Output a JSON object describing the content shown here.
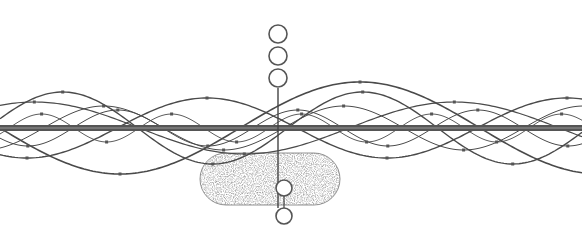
{
  "diagram": {
    "colors": {
      "background": "#ffffff",
      "line": "#4a4a4a",
      "bar": "#555555",
      "stipple": "#6e6e6e",
      "dot": "#555555"
    },
    "bar": {
      "y": 128,
      "x1": 0,
      "x2": 582,
      "thickness": 6
    },
    "axis": {
      "x": 278,
      "y1": 88,
      "y2": 208
    },
    "circles": [
      {
        "cx": 278,
        "cy": 34,
        "r": 9
      },
      {
        "cx": 278,
        "cy": 56,
        "r": 9
      },
      {
        "cx": 278,
        "cy": 78,
        "r": 9
      },
      {
        "cx": 284,
        "cy": 188,
        "r": 8,
        "filled_white": true
      },
      {
        "cx": 284,
        "cy": 216,
        "r": 8
      }
    ],
    "cell": {
      "x": 200,
      "y": 153,
      "width": 140,
      "height": 52,
      "rx": 26
    },
    "waves": [
      {
        "amp": 46,
        "period": 480,
        "phase": 0.0,
        "width": 1.6
      },
      {
        "amp": 30,
        "period": 360,
        "phase": 1.1,
        "width": 1.4
      },
      {
        "amp": 22,
        "period": 240,
        "phase": 2.0,
        "width": 1.0
      },
      {
        "amp": 18,
        "period": 180,
        "phase": 0.6,
        "width": 1.0
      },
      {
        "amp": 14,
        "period": 130,
        "phase": 2.7,
        "width": 0.9
      },
      {
        "amp": 36,
        "period": 300,
        "phase": 3.4,
        "width": 1.4
      },
      {
        "amp": 26,
        "period": 420,
        "phase": 4.2,
        "width": 1.2
      }
    ]
  }
}
